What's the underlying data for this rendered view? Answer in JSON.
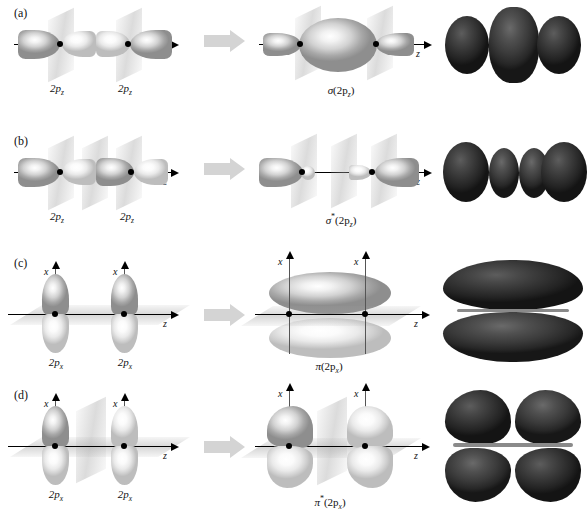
{
  "figure": {
    "background_color": "#ffffff",
    "arrow_color": "#d4d4d4",
    "lobe_color_light": "#f2f2f2",
    "lobe_color_shadow": "#8e8e8e",
    "photo_color": "#333333",
    "axis_color": "#000000"
  },
  "rows": [
    {
      "id": "a",
      "panel_label": "(a)",
      "atomic_orbital_label_left": "2p",
      "atomic_orbital_sub_left": "z",
      "atomic_orbital_label_right": "2p",
      "atomic_orbital_sub_right": "z",
      "axis_label_z": "z",
      "axis_label_x": "",
      "mo_label_prefix": "σ",
      "mo_label_star": "",
      "mo_label_body": "(2p",
      "mo_label_sub": "z",
      "mo_label_close": ")",
      "mo_label_full": "σ(2pz)",
      "description": "Constructive overlap of two 2pz orbitals forms the sigma bonding molecular orbital",
      "photo_lobe_count": 3,
      "nodal_planes": 2
    },
    {
      "id": "b",
      "panel_label": "(b)",
      "atomic_orbital_label_left": "2p",
      "atomic_orbital_sub_left": "z",
      "atomic_orbital_label_right": "2p",
      "atomic_orbital_sub_right": "z",
      "axis_label_z": "z",
      "axis_label_x": "",
      "mo_label_prefix": "σ",
      "mo_label_star": "*",
      "mo_label_body": "(2p",
      "mo_label_sub": "z",
      "mo_label_close": ")",
      "mo_label_full": "σ*(2pz)",
      "description": "Destructive overlap of two 2pz orbitals forms the sigma antibonding molecular orbital",
      "photo_lobe_count": 4,
      "nodal_planes": 3
    },
    {
      "id": "c",
      "panel_label": "(c)",
      "atomic_orbital_label_left": "2p",
      "atomic_orbital_sub_left": "x",
      "atomic_orbital_label_right": "2p",
      "atomic_orbital_sub_right": "x",
      "axis_label_z": "z",
      "axis_label_x": "x",
      "mo_label_prefix": "π",
      "mo_label_star": "",
      "mo_label_body": "(2p",
      "mo_label_sub": "x",
      "mo_label_close": ")",
      "mo_label_full": "π(2px)",
      "description": "Side-on constructive overlap of two 2px orbitals forms the pi bonding molecular orbital",
      "photo_lobe_count": 2,
      "nodal_planes": 1
    },
    {
      "id": "d",
      "panel_label": "(d)",
      "atomic_orbital_label_left": "2p",
      "atomic_orbital_sub_left": "x",
      "atomic_orbital_label_right": "2p",
      "atomic_orbital_sub_right": "x",
      "axis_label_z": "z",
      "axis_label_x": "x",
      "mo_label_prefix": "π",
      "mo_label_star": "*",
      "mo_label_body": "(2p",
      "mo_label_sub": "x",
      "mo_label_close": ")",
      "mo_label_full": "π*(2px)",
      "description": "Side-on destructive overlap of two 2px orbitals forms the pi antibonding molecular orbital",
      "photo_lobe_count": 4,
      "nodal_planes": 2
    }
  ]
}
